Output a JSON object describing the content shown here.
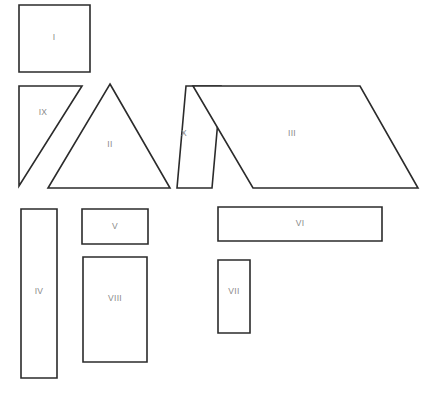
{
  "figure": {
    "width": 436,
    "height": 393,
    "background_color": "#ffffff",
    "stroke_color": "#2b2b2b",
    "fill_color": "#ffffff",
    "label_color": "#8a8a8a"
  },
  "shapes": [
    {
      "id": "shape-1",
      "label": "I",
      "kind": "square",
      "points": "19,5 90,5 90,72 19,72",
      "label_x": 54,
      "label_y": 38
    },
    {
      "id": "shape-9",
      "label": "IX",
      "kind": "right-triangle",
      "points": "19,86 82,86 19,186",
      "label_x": 43,
      "label_y": 113
    },
    {
      "id": "shape-2",
      "label": "II",
      "kind": "triangle",
      "points": "110,84 170,188 48,188",
      "label_x": 110,
      "label_y": 145
    },
    {
      "id": "shape-10",
      "label": "X",
      "kind": "parallelogram",
      "points": "186,86 221,86 212,188 177,188",
      "label_x": 184,
      "label_y": 134
    },
    {
      "id": "shape-3",
      "label": "III",
      "kind": "parallelogram",
      "points": "193,86 360,86 418,188 253,188",
      "label_x": 292,
      "label_y": 134
    },
    {
      "id": "shape-4",
      "label": "IV",
      "kind": "rectangle",
      "points": "21,209 57,209 57,378 21,378",
      "label_x": 39,
      "label_y": 292
    },
    {
      "id": "shape-5",
      "label": "V",
      "kind": "rectangle",
      "points": "82,209 148,209 148,244 82,244",
      "label_x": 115,
      "label_y": 227
    },
    {
      "id": "shape-8",
      "label": "VIII",
      "kind": "rectangle",
      "points": "83,257 147,257 147,362 83,362",
      "label_x": 115,
      "label_y": 299
    },
    {
      "id": "shape-6",
      "label": "VI",
      "kind": "rectangle",
      "points": "218,207 382,207 382,241 218,241",
      "label_x": 300,
      "label_y": 224
    },
    {
      "id": "shape-7",
      "label": "VII",
      "kind": "rectangle",
      "points": "218,260 250,260 250,333 218,333",
      "label_x": 234,
      "label_y": 292
    }
  ]
}
